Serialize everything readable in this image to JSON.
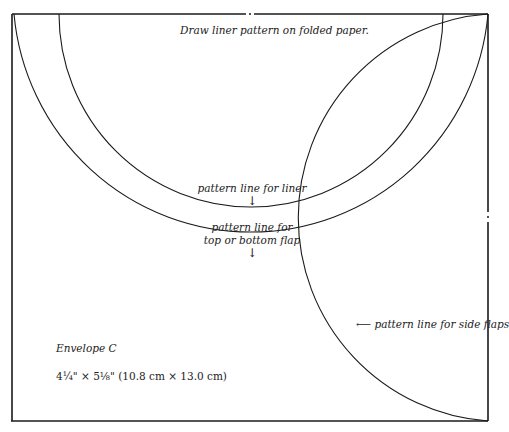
{
  "instruction": "Draw liner pattern on folded paper.",
  "labels": {
    "liner": "pattern line for liner",
    "flap_line1": "pattern line for",
    "flap_line2": "top or bottom flap",
    "side_flaps": "pattern line for side flaps",
    "arrow_down": "↓",
    "arrow_left": "⟵"
  },
  "envelope": {
    "name": "Envelope C",
    "dimensions": "4¼\" × 5⅛\" (10.8 cm × 13.0 cm)"
  },
  "colors": {
    "line": "#1a1a1a",
    "background": "#ffffff",
    "text": "#222222"
  }
}
